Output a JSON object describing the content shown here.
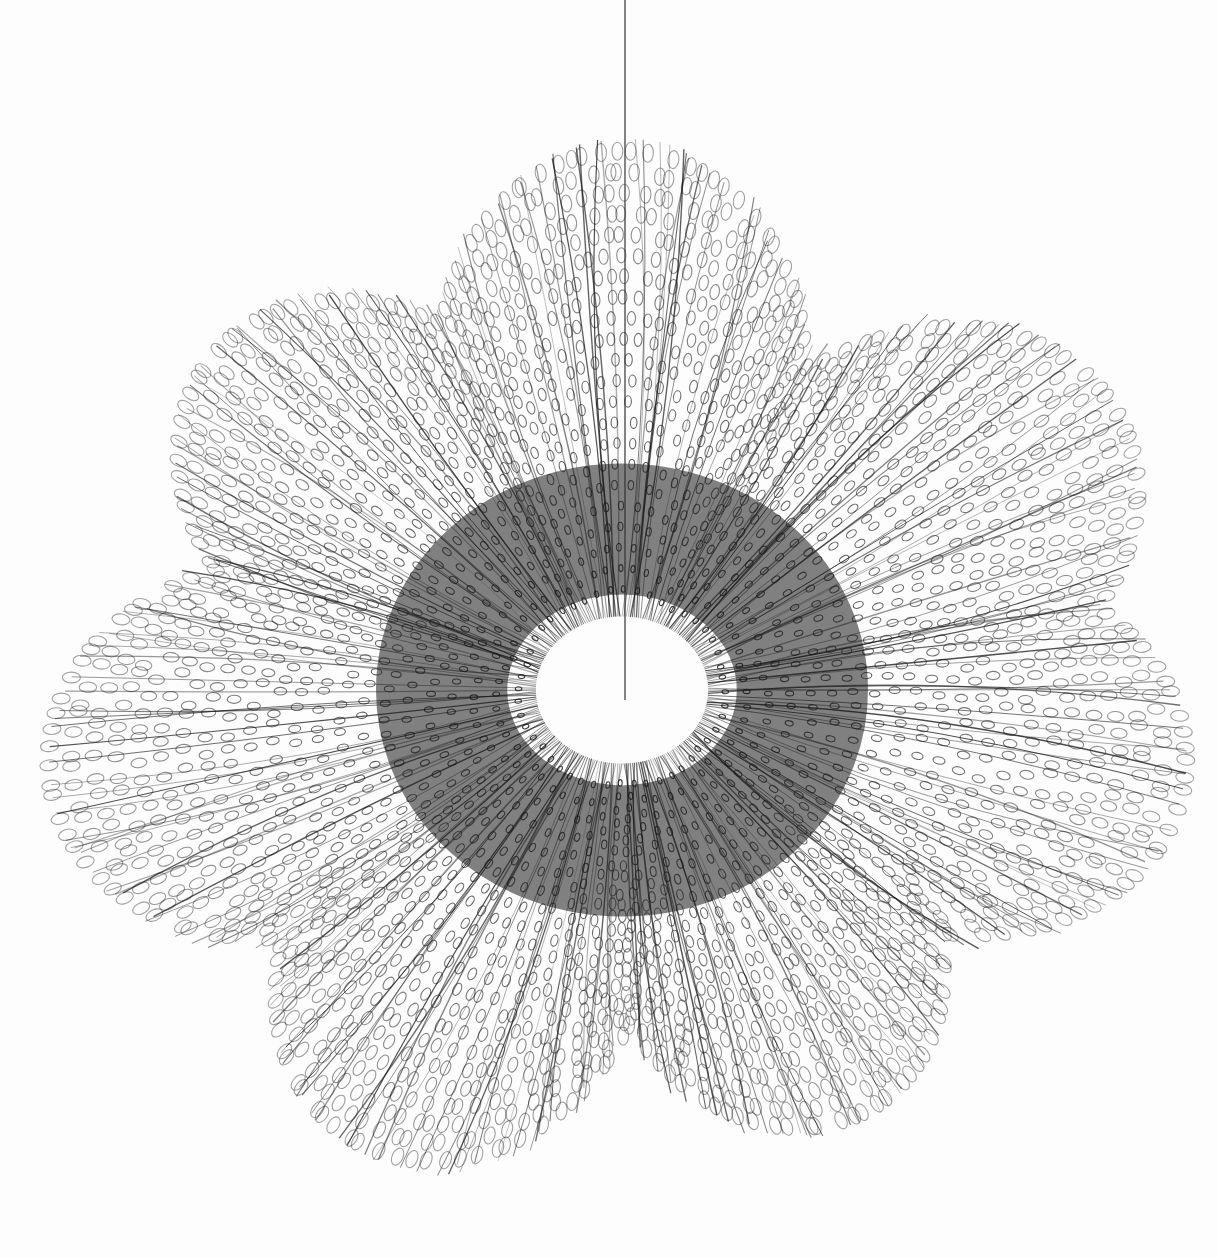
{
  "image": {
    "subject": "Hanging looped-wire sculpture, black and white photograph",
    "width": 1218,
    "height": 1258,
    "background_color": "#fdfdfd",
    "wire_color": "#1a1a1a"
  },
  "sculpture": {
    "center": [
      622,
      690
    ],
    "hole_radius": [
      82,
      70
    ],
    "lobes": [
      {
        "angle": -90,
        "reach": 580
      },
      {
        "angle": -140,
        "reach": 560
      },
      {
        "angle": -30,
        "reach": 600
      },
      {
        "angle": 10,
        "reach": 600
      },
      {
        "angle": 60,
        "reach": 520
      },
      {
        "angle": 120,
        "reach": 560
      },
      {
        "angle": 170,
        "reach": 610
      }
    ]
  },
  "suspension_wire": {
    "x": 625,
    "y_top": 0,
    "y_bottom": 700
  }
}
